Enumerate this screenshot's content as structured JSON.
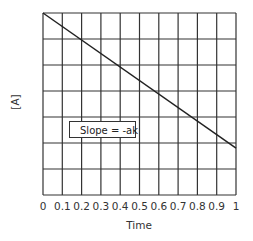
{
  "chart_data": {
    "type": "line",
    "title": "",
    "xlabel": "Time",
    "ylabel": "[A]",
    "x_ticks": [
      "0",
      "0.1",
      "0.2",
      "0.3",
      "0.4",
      "0.5",
      "0.6",
      "0.7",
      "0.8",
      "0.9",
      "1"
    ],
    "xlim": [
      0,
      1
    ],
    "ylim": [
      0,
      7
    ],
    "grid": true,
    "grid_rows": 7,
    "grid_cols": 10,
    "series": [
      {
        "name": "[A]",
        "x": [
          0,
          1
        ],
        "y": [
          7,
          1.8
        ]
      }
    ],
    "annotations": [
      {
        "text": "Slope = -ak",
        "boxed": true
      }
    ],
    "legend": null
  }
}
